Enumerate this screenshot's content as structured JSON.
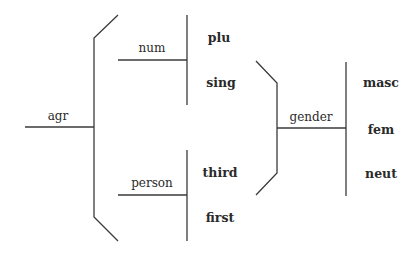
{
  "diagram": {
    "type": "feature-structure-tree",
    "root": {
      "label": "agr",
      "children": [
        {
          "label": "num",
          "values": [
            "plu",
            "sing"
          ]
        },
        {
          "label": "person",
          "values": [
            "third",
            "first"
          ],
          "subfeature": {
            "label": "gender",
            "values": [
              "masc",
              "fem",
              "neut"
            ]
          }
        }
      ]
    },
    "labels": {
      "agr": "agr",
      "num": "num",
      "person": "person",
      "gender": "gender",
      "plu": "plu",
      "sing": "sing",
      "third": "third",
      "first": "first",
      "masc": "masc",
      "fem": "fem",
      "neut": "neut"
    },
    "colors": {
      "line": "#3a3a3a",
      "text": "#2a2a2a",
      "background": "#ffffff"
    }
  }
}
